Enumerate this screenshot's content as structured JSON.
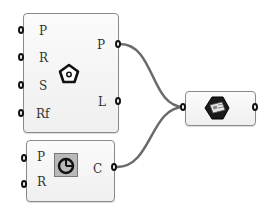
{
  "canvas": {
    "background": "#ffffff",
    "wire_color": "#666666"
  },
  "components": [
    {
      "id": "polygon",
      "icon": "pentagon-icon",
      "inputs": [
        {
          "label": "P"
        },
        {
          "label": "R"
        },
        {
          "label": "S"
        },
        {
          "label": "Rf"
        }
      ],
      "outputs": [
        {
          "label": "P"
        },
        {
          "label": "L"
        }
      ]
    },
    {
      "id": "circle",
      "icon": "circle-icon",
      "inputs": [
        {
          "label": "P"
        },
        {
          "label": "R"
        }
      ],
      "outputs": [
        {
          "label": "C"
        }
      ]
    },
    {
      "id": "param",
      "icon": "hexagon-document-icon",
      "inputs": [],
      "outputs": []
    }
  ],
  "wires": [
    {
      "from": "polygon.P",
      "to": "param.input"
    },
    {
      "from": "circle.C",
      "to": "param.input"
    }
  ]
}
